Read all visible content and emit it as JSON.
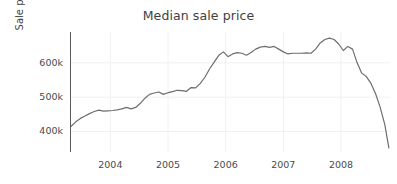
{
  "chart_data": {
    "type": "line",
    "title": "Median sale price",
    "xlabel": "",
    "ylabel": "Sale price (USD)",
    "xlim": [
      2003.3,
      2008.85
    ],
    "ylim": [
      340000,
      690000
    ],
    "grid": true,
    "legend": "none",
    "line_color": "#6e6e6e",
    "x_ticks": [
      2004,
      2005,
      2006,
      2007,
      2008
    ],
    "x_tick_labels": [
      "2004",
      "2005",
      "2006",
      "2007",
      "2008"
    ],
    "y_ticks": [
      400000,
      500000,
      600000
    ],
    "y_tick_labels": [
      "400k",
      "500k",
      "600k"
    ],
    "series": [
      {
        "name": "Median sale price",
        "x": [
          2003.32,
          2003.4,
          2003.48,
          2003.56,
          2003.64,
          2003.72,
          2003.8,
          2003.88,
          2003.96,
          2004.04,
          2004.12,
          2004.2,
          2004.28,
          2004.36,
          2004.44,
          2004.52,
          2004.6,
          2004.68,
          2004.76,
          2004.84,
          2004.92,
          2005.0,
          2005.08,
          2005.16,
          2005.24,
          2005.32,
          2005.4,
          2005.48,
          2005.56,
          2005.64,
          2005.72,
          2005.8,
          2005.88,
          2005.96,
          2006.04,
          2006.12,
          2006.2,
          2006.28,
          2006.36,
          2006.44,
          2006.52,
          2006.6,
          2006.68,
          2006.76,
          2006.84,
          2006.92,
          2007.0,
          2007.08,
          2007.16,
          2007.24,
          2007.32,
          2007.4,
          2007.48,
          2007.56,
          2007.64,
          2007.72,
          2007.8,
          2007.88,
          2007.96,
          2008.04,
          2008.12,
          2008.2,
          2008.28,
          2008.36,
          2008.44,
          2008.52,
          2008.6,
          2008.68,
          2008.76,
          2008.83
        ],
        "y": [
          415000,
          428000,
          438000,
          445000,
          452000,
          458000,
          462000,
          459000,
          460000,
          461000,
          463000,
          466000,
          470000,
          466000,
          470000,
          482000,
          497000,
          508000,
          512000,
          515000,
          508000,
          513000,
          516000,
          520000,
          519000,
          517000,
          528000,
          527000,
          540000,
          558000,
          582000,
          602000,
          622000,
          632000,
          618000,
          626000,
          630000,
          628000,
          622000,
          630000,
          640000,
          646000,
          648000,
          645000,
          648000,
          640000,
          632000,
          626000,
          628000,
          628000,
          628000,
          629000,
          628000,
          640000,
          658000,
          668000,
          672000,
          668000,
          655000,
          636000,
          648000,
          640000,
          600000,
          570000,
          560000,
          540000,
          510000,
          470000,
          420000,
          352000
        ]
      }
    ]
  },
  "axes": {
    "title": "Median sale price",
    "ylabel": "Sale price (USD)"
  }
}
